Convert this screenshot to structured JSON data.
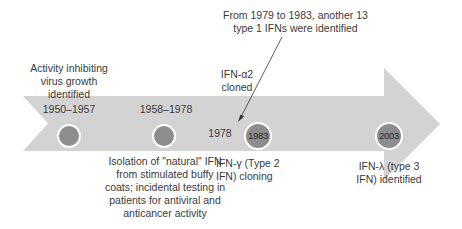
{
  "colors": {
    "arrow_fill": "#d3d3d3",
    "node_fill": "#8d8d8d",
    "node_border": "#ffffff",
    "text": "#3a3a3a",
    "pointer_line": "#333333"
  },
  "timeline": {
    "events": [
      {
        "date": "1950–1957",
        "label_lines": [
          "Activity inhibiting",
          "virus growth",
          "identified"
        ],
        "position": "above"
      },
      {
        "date": "1958–1978",
        "label_lines": [
          "Isolation of \"natural\" IFN",
          "from stimulated buffy",
          "coats; incidental testing in",
          "patients for antiviral and",
          "anticancer activity"
        ],
        "position": "below"
      },
      {
        "date": "1978",
        "label_lines": [
          "IFN-α2",
          "cloned"
        ],
        "position": "above"
      },
      {
        "date": "1983",
        "label_lines": [
          "IFN-γ (Type 2",
          "IFN) cloning"
        ],
        "position": "below"
      },
      {
        "date": "2003",
        "label_lines": [
          "IFN-λ (type 3",
          "IFN) identified"
        ],
        "position": "below"
      }
    ],
    "callout": {
      "lines": [
        "From 1979 to 1983, another 13",
        "type 1 IFNs were identified"
      ]
    }
  }
}
